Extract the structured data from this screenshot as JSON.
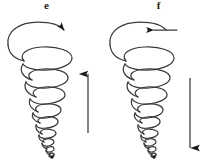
{
  "figure": {
    "background_color": "#ffffff",
    "stroke_color": "#3a3a3a",
    "arrow_color": "#1a1a1a",
    "width": 203,
    "height": 168
  },
  "panels": [
    {
      "id": "e",
      "label": "e",
      "description": "conical helical vortex, funnel narrowing downward to a point",
      "top_arc_arrow_direction": "right",
      "top_arc_arrow_name": "rotation-arrow-right",
      "vertical_arrow_direction": "up",
      "vertical_arrow_name": "axial-flow-arrow-up",
      "helix_turns": 9,
      "rotation_sense": "counterclockwise-viewed-from-above"
    },
    {
      "id": "f",
      "label": "f",
      "description": "conical helical vortex, funnel narrowing downward to a point",
      "top_arc_arrow_direction": "left",
      "top_arc_arrow_name": "rotation-arrow-left",
      "vertical_arrow_direction": "down",
      "vertical_arrow_name": "axial-flow-arrow-down",
      "helix_turns": 9,
      "rotation_sense": "clockwise-viewed-from-above"
    }
  ]
}
